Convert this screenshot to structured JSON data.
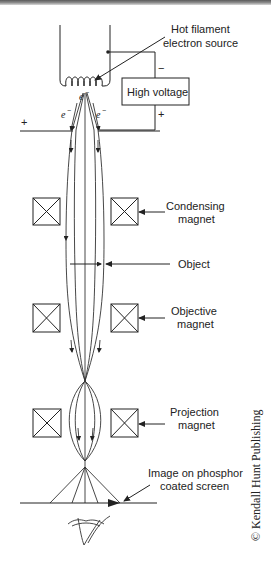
{
  "diagram": {
    "labels": {
      "filament_line1": "Hot filament",
      "filament_line2": "electron source",
      "high_voltage": "High voltage",
      "minus": "−",
      "plus_right": "+",
      "plus_left": "+",
      "electron_center": "e",
      "electron_left": "e",
      "electron_right": "e",
      "electron_sup": "−",
      "condensing_line1": "Condensing",
      "condensing_line2": "magnet",
      "object": "Object",
      "objective_line1": "Objective",
      "objective_line2": "magnet",
      "projection_line1": "Projection",
      "projection_line2": "magnet",
      "screen_line1": "Image on phosphor",
      "screen_line2": "coated screen"
    },
    "copyright": "© Kendall Hunt Publishing",
    "components": [
      {
        "name": "hot-filament-electron-source"
      },
      {
        "name": "high-voltage-supply"
      },
      {
        "name": "anode-plate"
      },
      {
        "name": "condensing-magnet"
      },
      {
        "name": "object"
      },
      {
        "name": "objective-magnet"
      },
      {
        "name": "projection-magnet"
      },
      {
        "name": "phosphor-screen"
      },
      {
        "name": "observer-eye"
      }
    ]
  }
}
